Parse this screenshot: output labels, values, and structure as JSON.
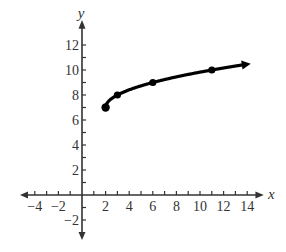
{
  "chart_data": {
    "type": "line",
    "title": "",
    "xlabel": "x",
    "ylabel": "y",
    "xlim": [
      -5,
      14.5
    ],
    "ylim": [
      -3,
      13
    ],
    "grid": false,
    "legend": null,
    "x_ticks": [
      -4,
      -2,
      2,
      4,
      6,
      8,
      10,
      12,
      14
    ],
    "y_ticks": [
      -2,
      2,
      4,
      6,
      8,
      10,
      12
    ],
    "series": [
      {
        "name": "y = sqrt(x - 2) + 7",
        "x": [
          2,
          3,
          6,
          11
        ],
        "y": [
          7,
          8,
          9,
          10
        ],
        "marked_points": [
          [
            2,
            7
          ],
          [
            3,
            8
          ],
          [
            6,
            9
          ],
          [
            11,
            10
          ]
        ],
        "start_closed_dot": [
          2,
          7
        ],
        "end_arrow": true,
        "color": "#000000"
      }
    ]
  }
}
